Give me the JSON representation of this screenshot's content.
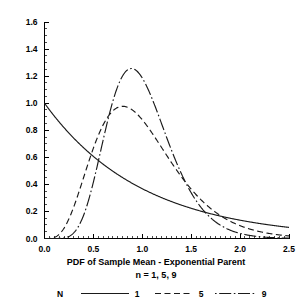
{
  "chart_data": {
    "type": "line",
    "title": "",
    "xlabel": "PDF of Sample Mean - Exponential Parent",
    "xlabel_line2": "n = 1, 5, 9",
    "ylabel": "",
    "xlim": [
      0.0,
      2.5
    ],
    "ylim": [
      0.0,
      1.6
    ],
    "grid": false,
    "legend_position": "bottom",
    "legend_title": "N",
    "x_ticks": [
      "0.0",
      "0.5",
      "1.0",
      "1.5",
      "2.0",
      "2.5"
    ],
    "x_tick_values": [
      0.0,
      0.5,
      1.0,
      1.5,
      2.0,
      2.5
    ],
    "x_minor_step": 0.05,
    "y_ticks": [
      "0.0",
      "0.2",
      "0.4",
      "0.6",
      "0.8",
      "1.0",
      "1.2",
      "1.4",
      "1.6"
    ],
    "y_tick_values": [
      0.0,
      0.2,
      0.4,
      0.6,
      0.8,
      1.0,
      1.2,
      1.4,
      1.6
    ],
    "y_minor_step": 0.05,
    "series": [
      {
        "name": "1",
        "legend_label": "1",
        "line_style": "solid",
        "n": 1,
        "peak_x": 0.0,
        "peak_y": 1.0,
        "x": [
          0.0,
          0.1,
          0.2,
          0.3,
          0.4,
          0.5,
          0.6,
          0.7,
          0.8,
          0.9,
          1.0,
          1.1,
          1.2,
          1.3,
          1.4,
          1.5,
          1.6,
          1.7,
          1.8,
          1.9,
          2.0,
          2.1,
          2.2,
          2.3,
          2.4,
          2.5
        ],
        "values": [
          1.0,
          0.905,
          0.819,
          0.741,
          0.67,
          0.607,
          0.549,
          0.497,
          0.449,
          0.407,
          0.368,
          0.333,
          0.301,
          0.273,
          0.247,
          0.223,
          0.202,
          0.183,
          0.165,
          0.15,
          0.135,
          0.122,
          0.111,
          0.1,
          0.091,
          0.082
        ]
      },
      {
        "name": "5",
        "legend_label": "5",
        "line_style": "dashed",
        "n": 5,
        "peak_x": 0.8,
        "peak_y": 0.98,
        "x": [
          0.0,
          0.1,
          0.2,
          0.3,
          0.4,
          0.5,
          0.6,
          0.7,
          0.8,
          0.9,
          1.0,
          1.1,
          1.2,
          1.3,
          1.4,
          1.5,
          1.6,
          1.7,
          1.8,
          1.9,
          2.0,
          2.1,
          2.2,
          2.3,
          2.4,
          2.5
        ],
        "values": [
          0.0,
          0.013,
          0.092,
          0.24,
          0.42,
          0.6,
          0.752,
          0.869,
          0.944,
          0.977,
          0.972,
          0.936,
          0.877,
          0.802,
          0.718,
          0.633,
          0.548,
          0.468,
          0.394,
          0.328,
          0.27,
          0.22,
          0.178,
          0.143,
          0.114,
          0.09
        ]
      },
      {
        "name": "9",
        "legend_label": "9",
        "line_style": "dashdot",
        "n": 9,
        "peak_x": 0.89,
        "peak_y": 1.26,
        "x": [
          0.0,
          0.1,
          0.2,
          0.3,
          0.4,
          0.5,
          0.6,
          0.7,
          0.8,
          0.9,
          1.0,
          1.1,
          1.2,
          1.3,
          1.4,
          1.5,
          1.6,
          1.7,
          1.8,
          1.9,
          2.0,
          2.1,
          2.2,
          2.3,
          2.4,
          2.5
        ],
        "values": [
          0.0,
          0.0,
          0.004,
          0.046,
          0.178,
          0.394,
          0.645,
          0.877,
          1.055,
          1.163,
          1.203,
          1.185,
          1.124,
          1.032,
          0.922,
          0.804,
          0.685,
          0.572,
          0.468,
          0.376,
          0.297,
          0.231,
          0.177,
          0.134,
          0.1,
          0.073
        ]
      }
    ]
  },
  "legend": {
    "title": "N",
    "entries": [
      {
        "label": "1",
        "style": "solid"
      },
      {
        "label": "5",
        "style": "dashed"
      },
      {
        "label": "9",
        "style": "dashdot"
      }
    ]
  },
  "caption": {
    "line1": "PDF of Sample Mean - Exponential Parent",
    "line2": "n = 1, 5, 9"
  },
  "colors": {
    "line": "#1a1a1a",
    "axis": "#000000",
    "background": "#ffffff",
    "text": "#000000"
  }
}
